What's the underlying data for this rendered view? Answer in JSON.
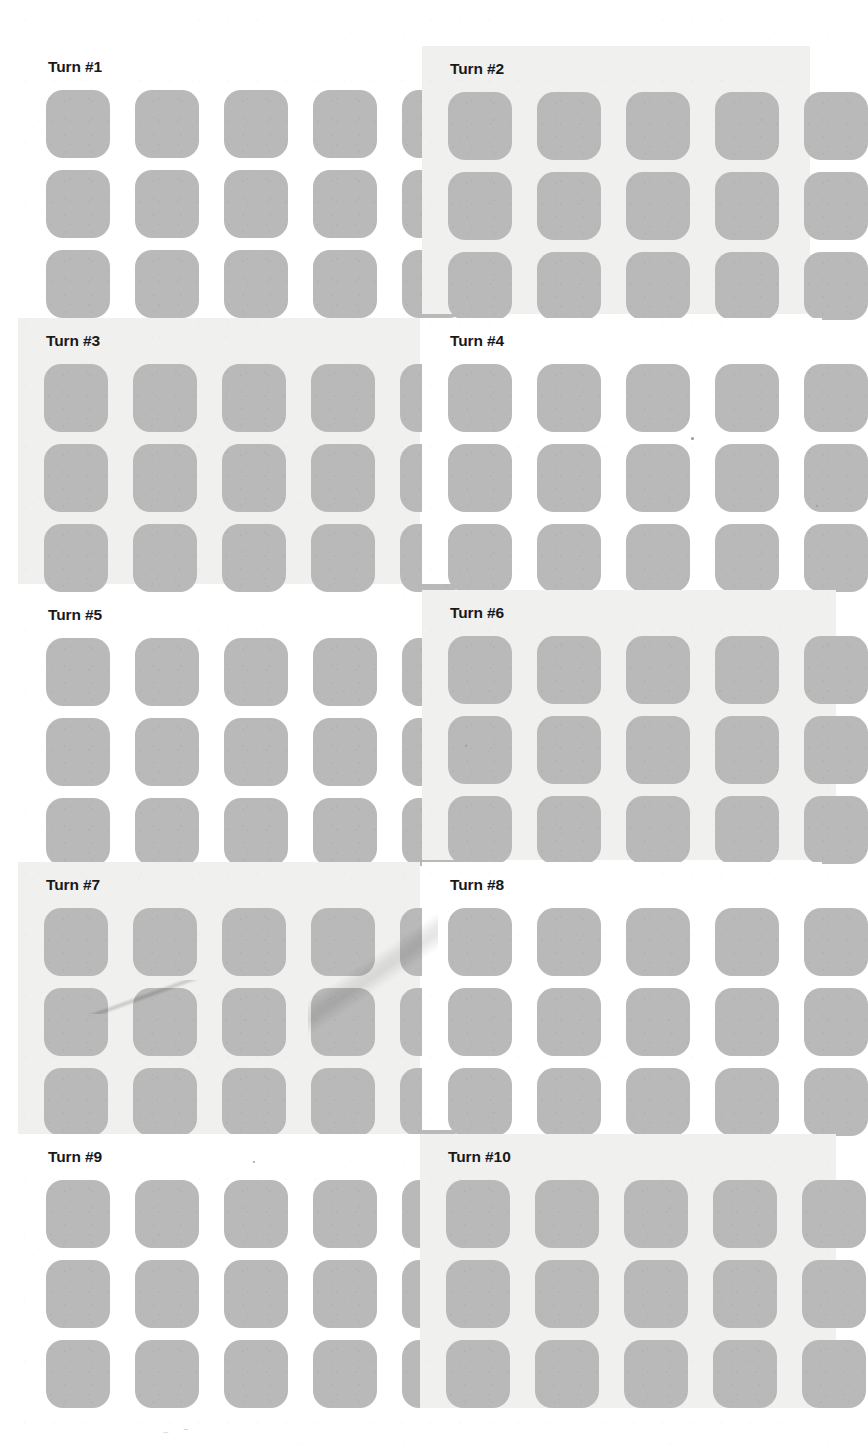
{
  "document": {
    "background_color": "#ffffff",
    "tile_color": "#b9b9b9",
    "tinted_panel_color": "#f0f0ee",
    "title_color": "#191919",
    "rows": 3,
    "columns": 5,
    "tiles_per_panel": 15,
    "panel_count": 10
  },
  "panels": [
    {
      "title": "Turn #1",
      "background": "plain",
      "geometry": {
        "left": 20,
        "top": 44,
        "width": 400,
        "height": 262
      },
      "artifacts": []
    },
    {
      "title": "Turn #2",
      "background": "tinted",
      "geometry": {
        "left": 422,
        "top": 46,
        "width": 388,
        "height": 268
      },
      "artifacts": []
    },
    {
      "title": "Turn #3",
      "background": "tinted",
      "geometry": {
        "left": 18,
        "top": 318,
        "width": 402,
        "height": 266
      },
      "artifacts": []
    },
    {
      "title": "Turn #4",
      "background": "plain",
      "geometry": {
        "left": 422,
        "top": 318,
        "width": 400,
        "height": 266
      },
      "artifacts": []
    },
    {
      "title": "Turn #5",
      "background": "plain",
      "geometry": {
        "left": 20,
        "top": 592,
        "width": 400,
        "height": 266
      },
      "artifacts": []
    },
    {
      "title": "Turn #6",
      "background": "tinted",
      "geometry": {
        "left": 422,
        "top": 590,
        "width": 414,
        "height": 270
      },
      "artifacts": []
    },
    {
      "title": "Turn #7",
      "background": "tinted",
      "geometry": {
        "left": 18,
        "top": 862,
        "width": 402,
        "height": 272
      },
      "artifacts": [
        "diagonal-streak",
        "thin-scratch-line"
      ]
    },
    {
      "title": "Turn #8",
      "background": "plain",
      "geometry": {
        "left": 422,
        "top": 862,
        "width": 400,
        "height": 268
      },
      "artifacts": []
    },
    {
      "title": "Turn #9",
      "background": "plain",
      "geometry": {
        "left": 20,
        "top": 1134,
        "width": 400,
        "height": 268
      },
      "artifacts": []
    },
    {
      "title": "Turn #10",
      "background": "tinted",
      "geometry": {
        "left": 420,
        "top": 1134,
        "width": 416,
        "height": 274
      },
      "artifacts": []
    }
  ],
  "specks": [
    {
      "left": 253,
      "top": 1161,
      "size": 2
    },
    {
      "left": 816,
      "top": 505,
      "size": 2
    },
    {
      "left": 691,
      "top": 437,
      "size": 3
    },
    {
      "left": 465,
      "top": 745,
      "size": 2
    }
  ]
}
